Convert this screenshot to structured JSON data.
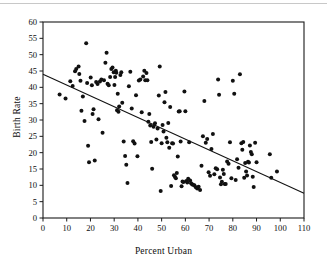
{
  "chart_data": {
    "type": "scatter",
    "title": "",
    "xlabel": "Percent Urban",
    "ylabel": "Birth Rate",
    "xlim": [
      0,
      110
    ],
    "ylim": [
      0,
      60
    ],
    "xticks": [
      0,
      10,
      20,
      30,
      40,
      50,
      60,
      70,
      80,
      90,
      100,
      110
    ],
    "yticks": [
      0,
      5,
      10,
      15,
      20,
      25,
      30,
      35,
      40,
      45,
      50,
      55,
      60
    ],
    "grid": false,
    "legend": null,
    "marker": {
      "shape": "circle",
      "color": "#111111",
      "size": 3.1
    },
    "trendline": {
      "label": "least-squares regression line",
      "color": "#111111",
      "x": [
        0,
        110
      ],
      "y": [
        44.0,
        7.6
      ]
    },
    "points": [
      [
        7.0,
        37.8
      ],
      [
        9.5,
        36.6
      ],
      [
        11.5,
        41.9
      ],
      [
        12.5,
        40.4
      ],
      [
        13.5,
        44.9
      ],
      [
        14.0,
        45.6
      ],
      [
        15.0,
        46.4
      ],
      [
        15.3,
        44.1
      ],
      [
        15.8,
        42.0
      ],
      [
        16.2,
        32.8
      ],
      [
        16.8,
        37.2
      ],
      [
        17.5,
        29.7
      ],
      [
        18.2,
        53.5
      ],
      [
        18.6,
        41.3
      ],
      [
        19.0,
        22.1
      ],
      [
        19.4,
        17.1
      ],
      [
        20.1,
        43.0
      ],
      [
        20.6,
        40.6
      ],
      [
        20.9,
        31.8
      ],
      [
        21.3,
        33.3
      ],
      [
        21.8,
        17.6
      ],
      [
        22.4,
        41.6
      ],
      [
        23.0,
        41.0
      ],
      [
        23.4,
        30.2
      ],
      [
        24.0,
        41.8
      ],
      [
        24.6,
        42.4
      ],
      [
        25.1,
        26.1
      ],
      [
        25.7,
        42.2
      ],
      [
        26.3,
        47.5
      ],
      [
        26.8,
        50.6
      ],
      [
        27.2,
        41.1
      ],
      [
        27.7,
        40.6
      ],
      [
        28.3,
        43.2
      ],
      [
        28.8,
        45.6
      ],
      [
        29.3,
        46.1
      ],
      [
        29.8,
        44.6
      ],
      [
        30.1,
        40.7
      ],
      [
        30.4,
        43.2
      ],
      [
        30.7,
        45.1
      ],
      [
        30.9,
        44.5
      ],
      [
        31.2,
        33.0
      ],
      [
        31.5,
        38.0
      ],
      [
        31.8,
        32.5
      ],
      [
        32.1,
        34.1
      ],
      [
        32.6,
        43.8
      ],
      [
        33.0,
        44.6
      ],
      [
        33.4,
        35.3
      ],
      [
        34.0,
        23.4
      ],
      [
        34.6,
        19.0
      ],
      [
        35.1,
        16.3
      ],
      [
        35.6,
        10.7
      ],
      [
        36.2,
        40.3
      ],
      [
        36.8,
        44.8
      ],
      [
        37.4,
        33.5
      ],
      [
        38.0,
        23.5
      ],
      [
        38.6,
        22.8
      ],
      [
        39.2,
        37.6
      ],
      [
        39.8,
        18.9
      ],
      [
        40.4,
        42.1
      ],
      [
        41.0,
        42.4
      ],
      [
        41.6,
        32.4
      ],
      [
        42.2,
        43.3
      ],
      [
        42.7,
        45.1
      ],
      [
        43.1,
        42.2
      ],
      [
        43.6,
        44.4
      ],
      [
        44.0,
        42.2
      ],
      [
        44.4,
        29.5
      ],
      [
        44.8,
        31.8
      ],
      [
        45.2,
        28.3
      ],
      [
        45.6,
        23.3
      ],
      [
        46.0,
        15.1
      ],
      [
        46.6,
        27.9
      ],
      [
        47.2,
        29.0
      ],
      [
        47.8,
        24.0
      ],
      [
        48.3,
        27.4
      ],
      [
        48.8,
        37.5
      ],
      [
        49.2,
        46.4
      ],
      [
        49.6,
        8.3
      ],
      [
        50.0,
        22.9
      ],
      [
        50.4,
        28.5
      ],
      [
        50.8,
        26.5
      ],
      [
        51.2,
        35.4
      ],
      [
        51.6,
        38.6
      ],
      [
        52.0,
        24.6
      ],
      [
        52.4,
        23.2
      ],
      [
        52.8,
        29.1
      ],
      [
        53.2,
        21.5
      ],
      [
        53.6,
        34.0
      ],
      [
        54.0,
        9.8
      ],
      [
        54.4,
        22.9
      ],
      [
        54.8,
        22.8
      ],
      [
        55.2,
        13.1
      ],
      [
        55.6,
        12.6
      ],
      [
        56.0,
        12.2
      ],
      [
        56.4,
        13.8
      ],
      [
        56.8,
        18.8
      ],
      [
        57.2,
        32.6
      ],
      [
        57.6,
        32.7
      ],
      [
        58.0,
        23.4
      ],
      [
        58.4,
        9.7
      ],
      [
        58.8,
        11.2
      ],
      [
        59.2,
        11.0
      ],
      [
        59.6,
        38.7
      ],
      [
        60.0,
        32.7
      ],
      [
        60.4,
        11.3
      ],
      [
        60.8,
        10.9
      ],
      [
        61.2,
        12.0
      ],
      [
        61.6,
        23.2
      ],
      [
        62.0,
        11.5
      ],
      [
        62.4,
        10.6
      ],
      [
        62.8,
        10.3
      ],
      [
        63.2,
        10.2
      ],
      [
        63.8,
        10.0
      ],
      [
        64.4,
        9.4
      ],
      [
        65.0,
        9.0
      ],
      [
        65.6,
        9.6
      ],
      [
        66.2,
        8.6
      ],
      [
        66.8,
        16.0
      ],
      [
        67.4,
        25.0
      ],
      [
        68.0,
        35.8
      ],
      [
        68.6,
        23.0
      ],
      [
        69.2,
        24.2
      ],
      [
        69.8,
        14.0
      ],
      [
        70.4,
        12.9
      ],
      [
        71.0,
        21.1
      ],
      [
        71.6,
        25.7
      ],
      [
        72.2,
        13.4
      ],
      [
        72.8,
        15.2
      ],
      [
        73.4,
        14.9
      ],
      [
        73.8,
        42.4
      ],
      [
        74.2,
        37.7
      ],
      [
        74.6,
        12.4
      ],
      [
        75.0,
        10.3
      ],
      [
        75.4,
        11.1
      ],
      [
        75.8,
        14.8
      ],
      [
        76.2,
        13.5
      ],
      [
        76.6,
        10.4
      ],
      [
        77.0,
        10.4
      ],
      [
        77.6,
        17.3
      ],
      [
        78.2,
        16.6
      ],
      [
        78.8,
        23.2
      ],
      [
        79.4,
        12.2
      ],
      [
        80.0,
        42.0
      ],
      [
        80.6,
        38.0
      ],
      [
        81.2,
        11.6
      ],
      [
        81.8,
        18.0
      ],
      [
        82.4,
        15.4
      ],
      [
        83.0,
        44.0
      ],
      [
        83.6,
        22.9
      ],
      [
        84.0,
        20.9
      ],
      [
        84.4,
        23.3
      ],
      [
        84.8,
        12.3
      ],
      [
        85.2,
        16.8
      ],
      [
        85.6,
        14.2
      ],
      [
        86.0,
        13.0
      ],
      [
        86.4,
        17.2
      ],
      [
        86.8,
        17.0
      ],
      [
        87.2,
        22.2
      ],
      [
        87.6,
        20.2
      ],
      [
        88.0,
        19.5
      ],
      [
        88.4,
        12.6
      ],
      [
        88.8,
        9.5
      ],
      [
        89.4,
        23.0
      ],
      [
        90.0,
        17.1
      ],
      [
        95.6,
        19.5
      ],
      [
        96.2,
        12.3
      ],
      [
        98.6,
        14.2
      ]
    ]
  }
}
